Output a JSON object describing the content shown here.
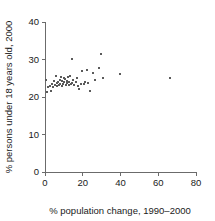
{
  "chart_data": {
    "type": "scatter",
    "title": "",
    "subtitle": "",
    "xlabel": "% population change, 1990–2000",
    "ylabel": "% persons under 18 years old, 2000",
    "xlim": [
      0,
      80
    ],
    "ylim": [
      0,
      40
    ],
    "xticks": [
      0,
      20,
      40,
      60,
      80
    ],
    "yticks": [
      0,
      10,
      20,
      30,
      40
    ],
    "xtick_labels": [
      "0",
      "20",
      "40",
      "60",
      "80"
    ],
    "ytick_labels": [
      "0",
      "10",
      "20",
      "30",
      "40"
    ],
    "grid": false,
    "legend": null,
    "marker": {
      "shape": "square",
      "size_px": 2,
      "color": "#5a5a5a"
    },
    "axis_color": "#6b6b6b",
    "background_color": "#ffffff",
    "series": [
      {
        "name": "states",
        "points": [
          [
            0.5,
            24.6
          ],
          [
            1.1,
            21.3
          ],
          [
            1.6,
            22.7
          ],
          [
            2.6,
            23.0
          ],
          [
            3.2,
            21.6
          ],
          [
            3.7,
            23.5
          ],
          [
            4.2,
            22.8
          ],
          [
            4.8,
            24.2
          ],
          [
            5.3,
            23.3
          ],
          [
            5.8,
            25.6
          ],
          [
            6.1,
            22.9
          ],
          [
            6.4,
            23.8
          ],
          [
            6.9,
            24.0
          ],
          [
            7.4,
            23.2
          ],
          [
            7.9,
            24.5
          ],
          [
            8.2,
            23.6
          ],
          [
            8.5,
            25.4
          ],
          [
            8.9,
            23.0
          ],
          [
            9.2,
            24.3
          ],
          [
            9.6,
            23.4
          ],
          [
            9.9,
            25.1
          ],
          [
            10.3,
            23.9
          ],
          [
            10.6,
            24.8
          ],
          [
            11.0,
            23.1
          ],
          [
            11.4,
            24.4
          ],
          [
            11.8,
            23.7
          ],
          [
            12.1,
            25.3
          ],
          [
            12.5,
            23.3
          ],
          [
            12.9,
            24.1
          ],
          [
            13.3,
            25.7
          ],
          [
            13.7,
            23.5
          ],
          [
            14.1,
            30.2
          ],
          [
            14.5,
            23.8
          ],
          [
            15.0,
            24.6
          ],
          [
            15.6,
            23.2
          ],
          [
            16.3,
            23.9
          ],
          [
            17.0,
            25.2
          ],
          [
            17.6,
            23.0
          ],
          [
            18.2,
            22.1
          ],
          [
            19.0,
            23.6
          ],
          [
            19.8,
            26.9
          ],
          [
            20.5,
            23.4
          ],
          [
            21.4,
            24.0
          ],
          [
            22.2,
            27.3
          ],
          [
            23.0,
            23.7
          ],
          [
            23.8,
            21.7
          ],
          [
            25.2,
            26.4
          ],
          [
            26.5,
            24.5
          ],
          [
            28.4,
            27.7
          ],
          [
            29.6,
            31.6
          ],
          [
            30.5,
            25.0
          ],
          [
            39.8,
            26.2
          ],
          [
            66.3,
            25.0
          ]
        ]
      }
    ]
  },
  "axes_geometry": {
    "x_origin_px": 45,
    "y_origin_px": 172,
    "x_max_px": 196,
    "y_max_px": 22
  }
}
